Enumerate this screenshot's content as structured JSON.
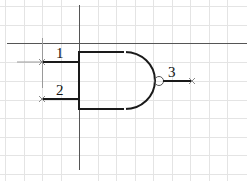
{
  "diagram": {
    "type": "logic-gate-schematic",
    "gate": "NAND",
    "pins": [
      {
        "id": "1",
        "label": "1",
        "role": "input"
      },
      {
        "id": "2",
        "label": "2",
        "role": "input"
      },
      {
        "id": "3",
        "label": "3",
        "role": "output"
      }
    ],
    "colors": {
      "grid": "#e4e4e4",
      "crosshair": "#555555",
      "wire": "#1a1a1a",
      "pin_marker": "#8a8a8a",
      "background": "#ffffff"
    }
  }
}
